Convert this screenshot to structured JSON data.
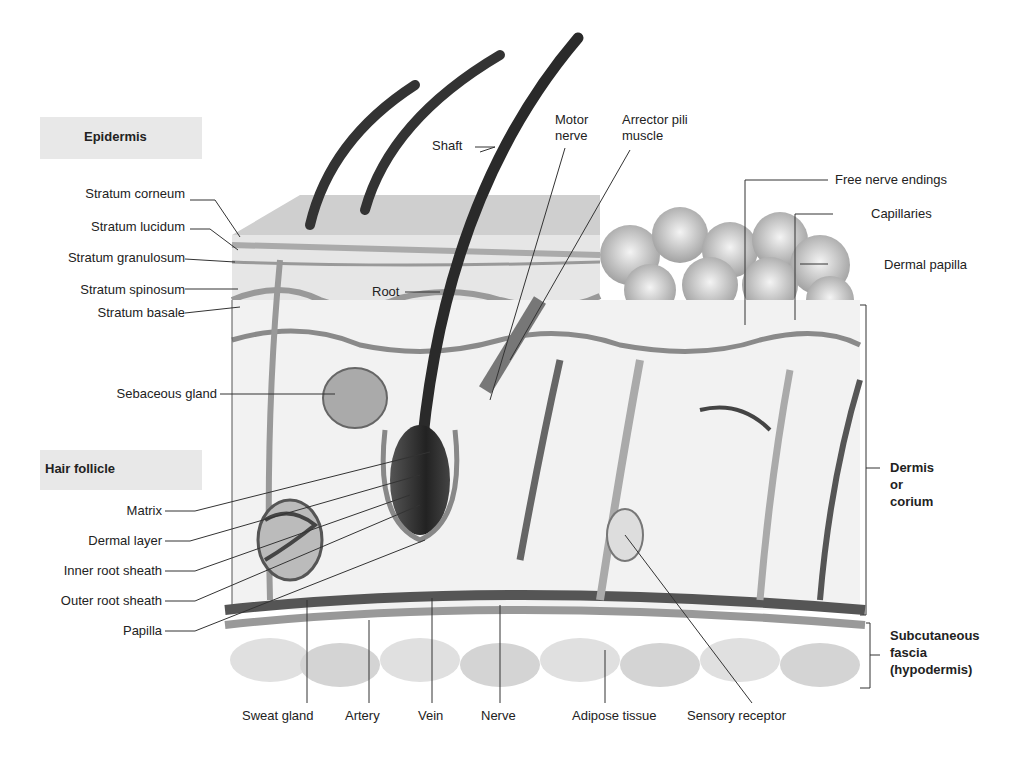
{
  "diagram": {
    "section_headers": {
      "epidermis": "Epidermis",
      "hair_follicle": "Hair follicle"
    },
    "epidermis_layers": [
      "Stratum corneum",
      "Stratum lucidum",
      "Stratum granulosum",
      "Stratum spinosum",
      "Stratum basale"
    ],
    "left_labels": {
      "sebaceous_gland": "Sebaceous gland"
    },
    "hair_follicle_parts": [
      "Matrix",
      "Dermal layer",
      "Inner root sheath",
      "Outer root sheath",
      "Papilla"
    ],
    "top_labels": {
      "shaft": "Shaft",
      "root": "Root",
      "motor_nerve_1": "Motor",
      "motor_nerve_2": "nerve",
      "arrector_1": "Arrector pili",
      "arrector_2": "muscle"
    },
    "right_labels": {
      "free_nerve_endings": "Free nerve endings",
      "capillaries": "Capillaries",
      "dermal_papilla": "Dermal papilla",
      "dermis_1": "Dermis",
      "dermis_2": "or",
      "dermis_3": "corium",
      "subq_1": "Subcutaneous",
      "subq_2": "fascia",
      "subq_3": "(hypodermis)"
    },
    "bottom_labels": [
      "Sweat gland",
      "Artery",
      "Vein",
      "Nerve",
      "Adipose tissue",
      "Sensory receptor"
    ]
  }
}
